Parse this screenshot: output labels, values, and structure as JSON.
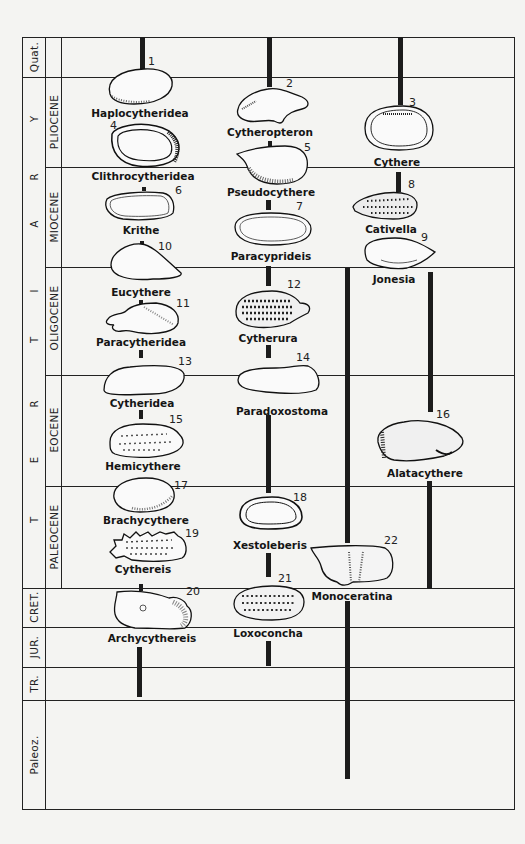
{
  "periods": [
    {
      "label": "Quat.",
      "y_top": 37,
      "y_bot": 77
    },
    {
      "label": "CRET.",
      "y_top": 588,
      "y_bot": 627
    },
    {
      "label": "JUR.",
      "y_top": 627,
      "y_bot": 667
    },
    {
      "label": "TR.",
      "y_top": 667,
      "y_bot": 700
    },
    {
      "label": "Paleoz.",
      "y_top": 700,
      "y_bot": 810
    }
  ],
  "tertiary": {
    "letters": [
      "T",
      "E",
      "R",
      "T",
      "I",
      "A",
      "R",
      "Y"
    ],
    "epochs": [
      {
        "label": "PLIOCENE",
        "y_top": 77,
        "y_bot": 167
      },
      {
        "label": "MIOCENE",
        "y_top": 167,
        "y_bot": 267
      },
      {
        "label": "OLIGOCENE",
        "y_top": 267,
        "y_bot": 375
      },
      {
        "label": "EOCENE",
        "y_top": 375,
        "y_bot": 486
      },
      {
        "label": "PALEOCENE",
        "y_top": 486,
        "y_bot": 588
      }
    ]
  },
  "genera": [
    {
      "num": "1",
      "name": "Haplocytheridea"
    },
    {
      "num": "2",
      "name": "Cytheropteron"
    },
    {
      "num": "3",
      "name": "Cythere"
    },
    {
      "num": "4",
      "name": "Clithrocytheridea"
    },
    {
      "num": "5",
      "name": "Pseudocythere"
    },
    {
      "num": "6",
      "name": "Krithe"
    },
    {
      "num": "7",
      "name": "Paracyprideis"
    },
    {
      "num": "8",
      "name": "Cativella"
    },
    {
      "num": "9",
      "name": "Jonesia"
    },
    {
      "num": "10",
      "name": "Eucythere"
    },
    {
      "num": "11",
      "name": "Paracytheridea"
    },
    {
      "num": "12",
      "name": "Cytherura"
    },
    {
      "num": "13",
      "name": "Cytheridea"
    },
    {
      "num": "14",
      "name": "Paradoxostoma"
    },
    {
      "num": "15",
      "name": "Hemicythere"
    },
    {
      "num": "16",
      "name": "Alatacythere"
    },
    {
      "num": "17",
      "name": "Brachycythere"
    },
    {
      "num": "18",
      "name": "Xestoleberis"
    },
    {
      "num": "19",
      "name": "Cythereis"
    },
    {
      "num": "20",
      "name": "Archycythereis"
    },
    {
      "num": "21",
      "name": "Loxoconcha"
    },
    {
      "num": "22",
      "name": "Monoceratina"
    }
  ]
}
